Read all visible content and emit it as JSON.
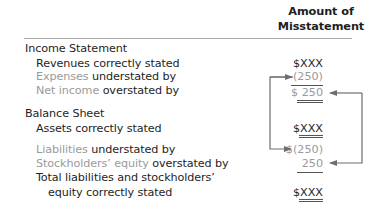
{
  "header": {
    "line1": "Amount of",
    "line2": "Misstatement"
  },
  "income_statement": {
    "title": "Income Statement",
    "rows": [
      {
        "prefix": "",
        "highlight": "",
        "label": "Revenues correctly stated",
        "value": "$XXX"
      },
      {
        "highlight": "Expenses",
        "label": " understated by",
        "value": "(250)"
      },
      {
        "highlight": "Net income",
        "label": " overstated by",
        "value": "$ 250"
      }
    ]
  },
  "balance_sheet": {
    "title": "Balance Sheet",
    "rows": [
      {
        "highlight": "",
        "label": "Assets correctly stated",
        "value": "$XXX"
      },
      {
        "highlight": "Liabilities",
        "label": " understated by",
        "value": "$(250)"
      },
      {
        "highlight": "Stockholders’ equity",
        "label": " overstated by",
        "value": "250"
      },
      {
        "label": "Total liabilities and stockholders’",
        "label2": "equity correctly stated",
        "value": "$XXX"
      }
    ]
  },
  "colors": {
    "text": "#1e1e1e",
    "highlight_text": "#9a9a9a",
    "arrow": "#6e6e6e",
    "rule": "#aaaaaa"
  },
  "arrows": [
    {
      "from": "liabilities-understated",
      "to": "expenses-understated",
      "side": "left"
    },
    {
      "from": "net-income-overstated",
      "to": "stockholders-equity-overstated",
      "side": "right"
    }
  ]
}
